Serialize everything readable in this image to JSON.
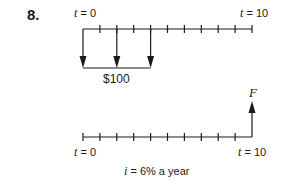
{
  "problem": {
    "number": "8."
  },
  "top_timeline": {
    "start_label_var": "t",
    "start_label_rest": " = 0",
    "end_label_var": "t",
    "end_label_rest": " = 10",
    "payment_label": "$100",
    "payment_periods": [
      0,
      2,
      4
    ],
    "periods": 10
  },
  "bottom_timeline": {
    "start_label_var": "t",
    "start_label_rest": " = 0",
    "end_label_var": "t",
    "end_label_rest": " = 10",
    "future_value_label": "F",
    "periods": 10
  },
  "interest": {
    "var": "i",
    "rest": " = 6% a year"
  },
  "colors": {
    "line": "#1a1a1a",
    "background": "#ffffff"
  }
}
